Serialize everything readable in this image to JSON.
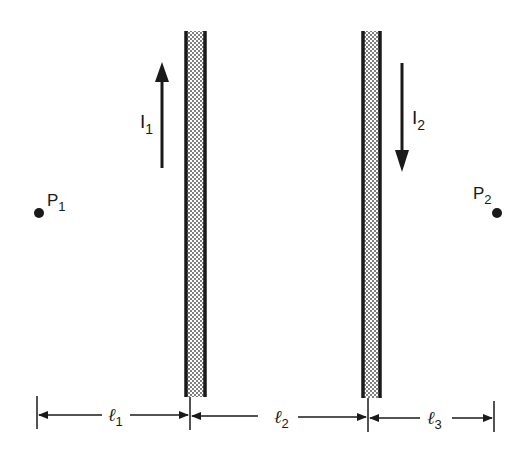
{
  "diagram": {
    "colors": {
      "line": "#1a1a1a",
      "stipple": "#444444",
      "background": "#ffffff"
    },
    "wires": [
      {
        "id": "wire-1",
        "current_label": "I",
        "current_sub": "1",
        "current_direction": "up"
      },
      {
        "id": "wire-2",
        "current_label": "I",
        "current_sub": "2",
        "current_direction": "down"
      }
    ],
    "points": [
      {
        "id": "P1",
        "label": "P",
        "sub": "1"
      },
      {
        "id": "P2",
        "label": "P",
        "sub": "2"
      }
    ],
    "dimensions": [
      {
        "id": "l1",
        "label": "ℓ",
        "sub": "1"
      },
      {
        "id": "l2",
        "label": "ℓ",
        "sub": "2"
      },
      {
        "id": "l3",
        "label": "ℓ",
        "sub": "3"
      }
    ]
  }
}
